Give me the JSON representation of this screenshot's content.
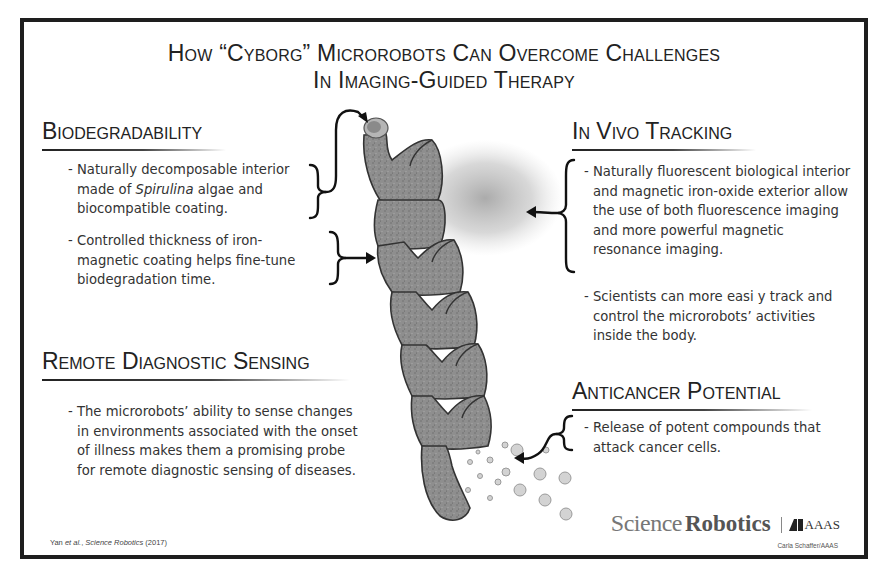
{
  "title": {
    "line1": "How “Cyborg” Microrobots Can Overcome Challenges",
    "line2": "In Imaging-Guided Therapy"
  },
  "sections": {
    "biodegradability": {
      "heading": "Biodegradability",
      "bullets": [
        {
          "pre": "- Naturally decomposable interior made of ",
          "italic": "Spirulina",
          "post": " algae and biocompatible coating."
        },
        {
          "text": "- Controlled thickness of iron-magnetic coating helps fine-tune biodegradation time."
        }
      ]
    },
    "in_vivo_tracking": {
      "heading": "In Vivo Tracking",
      "bullets": [
        {
          "text": "- Naturally fluorescent biological interior and magnetic iron-oxide exterior allow the use of both fluorescence imaging and more powerful magnetic resonance imaging."
        },
        {
          "text": "- Scientists can more easi y track and control the microrobots’ activities inside the body."
        }
      ]
    },
    "remote_sensing": {
      "heading": "Remote Diagnostic Sensing",
      "bullets": [
        {
          "text": "- The microrobots’ ability to sense changes in environments associated with the onset of illness makes them a promising probe for remote diagnostic sensing of diseases."
        }
      ]
    },
    "anticancer": {
      "heading": "Anticancer Potential",
      "bullets": [
        {
          "text": "- Release of potent compounds that attack cancer cells."
        }
      ]
    }
  },
  "footer": {
    "citation_pre": "Yan ",
    "citation_italic1": "et al.",
    "citation_mid": ", ",
    "citation_italic2": "Science Robotics",
    "citation_post": " (2017)",
    "logo_science": "Science",
    "logo_robotics": "Robotics",
    "logo_aaas": "AAAS",
    "credit": "Carla Schaffer/AAAS"
  },
  "illustration": {
    "subject": "spiral-microrobot",
    "colors": {
      "body": "#8c8c8c",
      "outline": "#3a3a3a",
      "fluorescence_cloud": "#9a9a9a",
      "particles": "#c8c8c8",
      "frame": "#1e1e1e"
    }
  }
}
